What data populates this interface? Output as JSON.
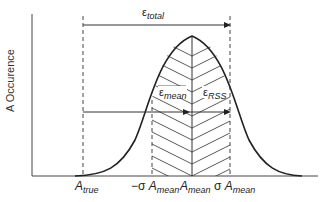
{
  "diagram": {
    "y_axis_label": "A Occurence",
    "annotations": {
      "e_total": {
        "symbol": "ε",
        "subscript": "total"
      },
      "e_mean": {
        "symbol": "ε",
        "subscript": "mean"
      },
      "e_rss": {
        "symbol": "ε",
        "subscript": "RSS"
      }
    },
    "x_ticks": [
      {
        "id": "a_true",
        "prefix": "",
        "symbol": "A",
        "subscript": "true"
      },
      {
        "id": "minus_sigma",
        "prefix": "−σ ",
        "symbol": "A",
        "subscript": "mean"
      },
      {
        "id": "mean",
        "prefix": "",
        "symbol": "A",
        "subscript": "mean"
      },
      {
        "id": "plus_sigma",
        "prefix": "σ ",
        "symbol": "A",
        "subscript": "mean"
      }
    ],
    "colors": {
      "line": "#222222",
      "background": "#ffffff"
    }
  }
}
